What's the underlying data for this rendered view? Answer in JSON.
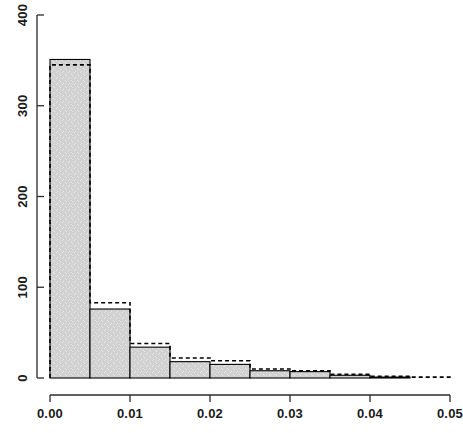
{
  "chart_data": {
    "type": "bar",
    "title": "",
    "subtitle": "",
    "xlabel": "",
    "ylabel": "",
    "grid": false,
    "legend": null,
    "xlim": [
      0.0,
      0.05
    ],
    "ylim": [
      0,
      400
    ],
    "xticks": [
      "0.00",
      "0.01",
      "0.02",
      "0.03",
      "0.04",
      "0.05"
    ],
    "xtick_values": [
      0.0,
      0.01,
      0.02,
      0.03,
      0.04,
      0.05
    ],
    "yticks": [
      "0",
      "100",
      "200",
      "300",
      "400"
    ],
    "ytick_values": [
      0,
      100,
      200,
      300,
      400
    ],
    "bin_width": 0.005,
    "bin_edges": [
      0.0,
      0.005,
      0.01,
      0.015,
      0.02,
      0.025,
      0.03,
      0.035,
      0.04,
      0.045,
      0.05
    ],
    "categories": [
      "0.000-0.005",
      "0.005-0.010",
      "0.010-0.015",
      "0.015-0.020",
      "0.020-0.025",
      "0.025-0.030",
      "0.030-0.035",
      "0.035-0.040",
      "0.040-0.045",
      "0.045-0.050"
    ],
    "series": [
      {
        "name": "histogram-bars",
        "style": "filled-bars",
        "fill": "#d4d4d4",
        "stroke": "#000000",
        "values": [
          351,
          76,
          34,
          18,
          15,
          8,
          7,
          3,
          1,
          0
        ]
      },
      {
        "name": "overlay-step",
        "style": "dashed-step",
        "fill": "none",
        "stroke": "#000000",
        "values": [
          345,
          83,
          38,
          22,
          19,
          10,
          8,
          4,
          2,
          1
        ]
      }
    ]
  },
  "colors": {
    "bar_fill": "#d4d4d4",
    "bar_stroke": "#000000",
    "overlay_stroke": "#000000",
    "axis": "#2b2b2b",
    "background": "#ffffff"
  }
}
